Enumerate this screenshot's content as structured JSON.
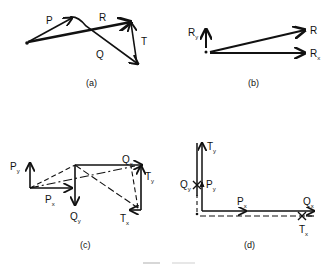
{
  "figure": {
    "panels": [
      {
        "id": "a",
        "caption": "(a)",
        "vectors": [
          {
            "label": "P"
          },
          {
            "label": "Q"
          },
          {
            "label": "R"
          },
          {
            "label": "T"
          }
        ]
      },
      {
        "id": "b",
        "caption": "(b)",
        "vectors": [
          {
            "label": "R"
          },
          {
            "label": "R",
            "sub": "y"
          },
          {
            "label": "R",
            "sub": "x"
          }
        ]
      },
      {
        "id": "c",
        "caption": "(c)",
        "vectors": [
          {
            "label": "P",
            "sub": "y"
          },
          {
            "label": "P",
            "sub": "x"
          },
          {
            "label": "Q",
            "sub": "y"
          },
          {
            "label": "Q",
            "sub": "x"
          },
          {
            "label": "T",
            "sub": "y"
          },
          {
            "label": "T",
            "sub": "x"
          }
        ]
      },
      {
        "id": "d",
        "caption": "(d)",
        "vectors": [
          {
            "label": "T",
            "sub": "y"
          },
          {
            "label": "Q",
            "sub": "y"
          },
          {
            "label": "P",
            "sub": "y"
          },
          {
            "label": "P",
            "sub": "x"
          },
          {
            "label": "Q",
            "sub": "x"
          },
          {
            "label": "T",
            "sub": "x"
          }
        ]
      }
    ]
  }
}
